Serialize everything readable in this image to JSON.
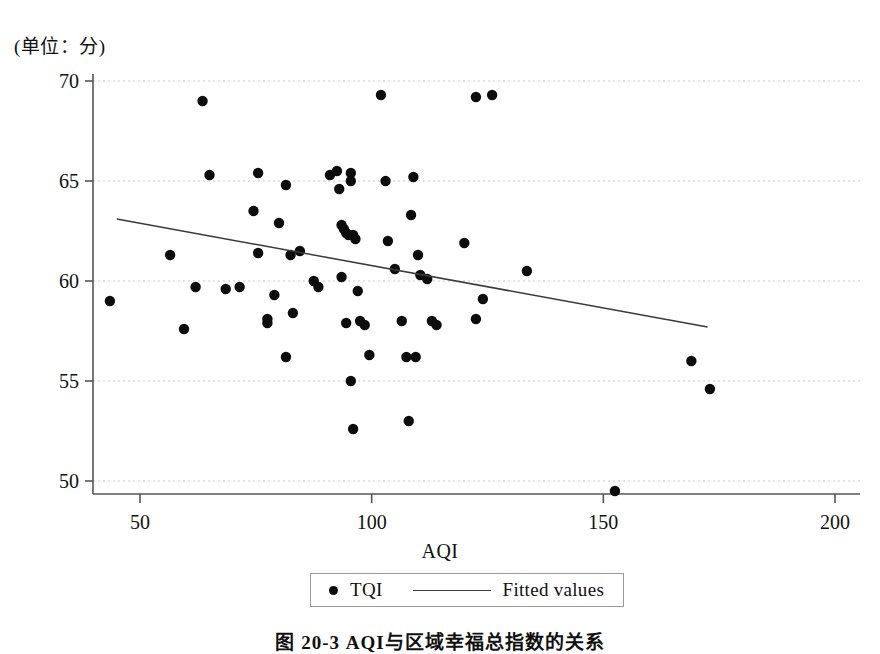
{
  "figure": {
    "caption": "图 20-3   AQI与区域幸福总指数的关系",
    "y_unit_label": "(单位：分)",
    "x_axis_title": "AQI"
  },
  "legend": {
    "entries": [
      {
        "name": "points",
        "marker": "dot",
        "label": "TQI"
      },
      {
        "name": "fit",
        "marker": "line",
        "label": "Fitted values"
      }
    ]
  },
  "style": {
    "point_color": "#0d0d0d",
    "line_color": "#3a3a3a",
    "grid_color": "#c9c9c9",
    "axis_color": "#555555"
  },
  "chart_data": {
    "type": "scatter",
    "title": "图 20-3   AQI与区域幸福总指数的关系",
    "xlabel": "AQI",
    "ylabel": "(单位：分)",
    "xlim": [
      42,
      178
    ],
    "ylim": [
      48.5,
      70.5
    ],
    "xticks": [
      50,
      100,
      150,
      200
    ],
    "yticks": [
      50,
      55,
      60,
      65,
      70
    ],
    "grid": "horizontal-dashed",
    "legend_position": "below-axis-center",
    "series": [
      {
        "name": "TQI",
        "type": "scatter",
        "marker": "filled-circle",
        "points": [
          [
            43.5,
            59.0
          ],
          [
            56.5,
            61.3
          ],
          [
            62.0,
            59.7
          ],
          [
            63.5,
            69.0
          ],
          [
            59.5,
            57.6
          ],
          [
            65.0,
            65.3
          ],
          [
            68.5,
            59.6
          ],
          [
            71.5,
            59.7
          ],
          [
            74.5,
            63.5
          ],
          [
            75.5,
            65.4
          ],
          [
            75.5,
            61.4
          ],
          [
            77.5,
            58.1
          ],
          [
            77.5,
            57.9
          ],
          [
            79.0,
            59.3
          ],
          [
            80.0,
            62.9
          ],
          [
            81.5,
            64.8
          ],
          [
            82.5,
            61.3
          ],
          [
            83.0,
            58.4
          ],
          [
            84.5,
            61.5
          ],
          [
            81.5,
            56.2
          ],
          [
            87.5,
            60.0
          ],
          [
            88.5,
            59.7
          ],
          [
            91.0,
            65.3
          ],
          [
            92.5,
            65.5
          ],
          [
            93.0,
            64.6
          ],
          [
            93.5,
            62.8
          ],
          [
            94.0,
            62.6
          ],
          [
            94.5,
            62.4
          ],
          [
            95.0,
            62.3
          ],
          [
            95.5,
            65.4
          ],
          [
            95.5,
            65.0
          ],
          [
            96.0,
            62.3
          ],
          [
            96.5,
            62.1
          ],
          [
            93.5,
            60.2
          ],
          [
            94.5,
            57.9
          ],
          [
            95.5,
            55.0
          ],
          [
            96.0,
            52.6
          ],
          [
            97.0,
            59.5
          ],
          [
            97.5,
            58.0
          ],
          [
            98.5,
            57.8
          ],
          [
            99.5,
            56.3
          ],
          [
            102.0,
            69.3
          ],
          [
            103.0,
            65.0
          ],
          [
            103.5,
            62.0
          ],
          [
            105.0,
            60.6
          ],
          [
            106.5,
            58.0
          ],
          [
            107.5,
            56.2
          ],
          [
            108.0,
            53.0
          ],
          [
            109.5,
            56.2
          ],
          [
            108.5,
            63.3
          ],
          [
            109.0,
            65.2
          ],
          [
            110.0,
            61.3
          ],
          [
            110.5,
            60.3
          ],
          [
            112.0,
            60.1
          ],
          [
            113.0,
            58.0
          ],
          [
            114.0,
            57.8
          ],
          [
            122.5,
            69.2
          ],
          [
            126.0,
            69.3
          ],
          [
            120.0,
            61.9
          ],
          [
            124.0,
            59.1
          ],
          [
            122.5,
            58.1
          ],
          [
            133.5,
            60.5
          ],
          [
            152.5,
            49.5
          ],
          [
            169.0,
            56.0
          ],
          [
            173.0,
            54.6
          ]
        ]
      },
      {
        "name": "Fitted values",
        "type": "line",
        "x": [
          45.0,
          172.5
        ],
        "y": [
          63.1,
          57.7
        ]
      }
    ]
  }
}
